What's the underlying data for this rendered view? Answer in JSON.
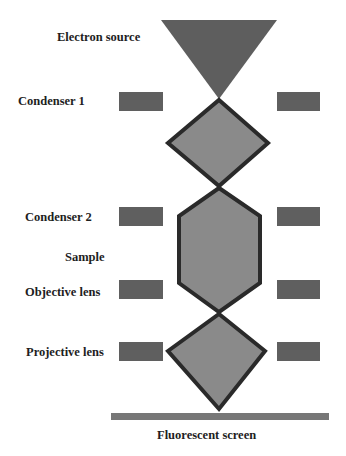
{
  "colors": {
    "source_fill": "#5e5e5e",
    "lens_fill": "#8a8a8a",
    "lens_stroke": "#2a2a2a",
    "coil_fill": "#5f5f5f",
    "screen_fill": "#777777",
    "text": "#1e1e1e"
  },
  "labels": {
    "electron_source": "Electron source",
    "condenser_1": "Condenser 1",
    "condenser_2": "Condenser 2",
    "sample": "Sample",
    "objective_lens": "Objective lens",
    "projective_lens": "Projective lens",
    "fluorescent_screen": "Fluorescent screen"
  },
  "components": [
    {
      "name": "Electron source",
      "shape": "inverted-triangle"
    },
    {
      "name": "Condenser 1",
      "shape": "coil-pair"
    },
    {
      "name": "Condenser 2",
      "shape": "coil-pair"
    },
    {
      "name": "Sample",
      "shape": "beam-hexagon"
    },
    {
      "name": "Objective lens",
      "shape": "coil-pair"
    },
    {
      "name": "Projective lens",
      "shape": "coil-pair"
    },
    {
      "name": "Fluorescent screen",
      "shape": "bar"
    }
  ]
}
